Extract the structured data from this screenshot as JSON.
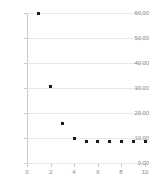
{
  "chart_data": {
    "type": "scatter",
    "title": "",
    "subtitle": "",
    "xlabel": "",
    "ylabel": "",
    "xlim": [
      0,
      10
    ],
    "ylim": [
      0,
      60
    ],
    "grid": true,
    "legend": false,
    "marker": "square",
    "marker_color": "#1a1a1a",
    "gridline_color": "#e8e8e8",
    "axis_color": "#c9c9c9",
    "tick_label_color": "#8a8a8a",
    "decimal_separator": ",",
    "x": [
      1,
      2,
      3,
      4,
      5,
      6,
      7,
      8,
      9,
      10
    ],
    "values": [
      60.0,
      30.5,
      16.0,
      10.0,
      8.5,
      8.5,
      8.5,
      8.5,
      8.5,
      8.5
    ],
    "series": [
      {
        "name": "",
        "points": [
          {
            "x": 1,
            "y": 60.0
          },
          {
            "x": 2,
            "y": 30.5
          },
          {
            "x": 3,
            "y": 16.0
          },
          {
            "x": 4,
            "y": 10.0
          },
          {
            "x": 5,
            "y": 8.5
          },
          {
            "x": 6,
            "y": 8.5
          },
          {
            "x": 7,
            "y": 8.5
          },
          {
            "x": 8,
            "y": 8.5
          },
          {
            "x": 9,
            "y": 8.5
          },
          {
            "x": 10,
            "y": 8.5
          }
        ]
      }
    ],
    "yticks": [
      {
        "value": 60,
        "label": "60,00"
      },
      {
        "value": 50,
        "label": "50,00"
      },
      {
        "value": 40,
        "label": "40,00"
      },
      {
        "value": 30,
        "label": "30,00"
      },
      {
        "value": 20,
        "label": "20,00"
      },
      {
        "value": 10,
        "label": "10,00"
      },
      {
        "value": 0,
        "label": "0,00"
      }
    ],
    "xticks": [
      {
        "value": 0,
        "label": "0"
      },
      {
        "value": 2,
        "label": "2"
      },
      {
        "value": 4,
        "label": "4"
      },
      {
        "value": 6,
        "label": "6"
      },
      {
        "value": 8,
        "label": "8"
      },
      {
        "value": 10,
        "label": "10"
      }
    ]
  }
}
